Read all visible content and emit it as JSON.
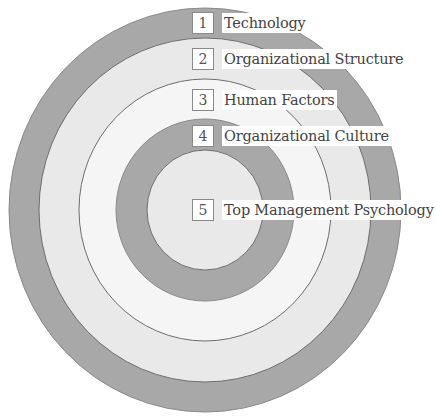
{
  "diagram": {
    "type": "concentric-circles",
    "center": [
      205,
      210
    ],
    "colors": {
      "dark_ring": "#a8a8a8",
      "light_ring": "#e9e9e9",
      "white_ring": "#f5f5f5",
      "stroke": "#7a7a7a"
    },
    "rings": [
      {
        "level": 1,
        "label": "Technology",
        "outer_radius": 199,
        "fill": "#a8a8a8"
      },
      {
        "level": 2,
        "label": "Organizational Structure",
        "outer_radius": 169,
        "fill": "#e9e9e9"
      },
      {
        "level": 3,
        "label": "Human Factors",
        "outer_radius": 129,
        "fill": "#f5f5f5"
      },
      {
        "level": 4,
        "label": "Organizational Culture",
        "outer_radius": 89,
        "fill": "#a8a8a8"
      },
      {
        "level": 5,
        "label": "Top Management Psychology",
        "outer_radius": 58,
        "fill": "#e9e9e9"
      }
    ]
  },
  "labels": [
    {
      "number": "1",
      "text": "Technology"
    },
    {
      "number": "2",
      "text": "Organizational Structure"
    },
    {
      "number": "3",
      "text": "Human Factors"
    },
    {
      "number": "4",
      "text": "Organizational Culture"
    },
    {
      "number": "5",
      "text": "Top Management Psychology"
    }
  ]
}
